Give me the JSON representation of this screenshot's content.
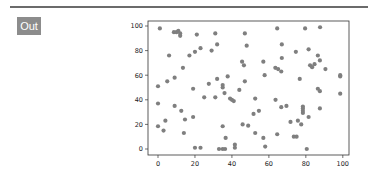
{
  "cell": {
    "prompt_label": "Out"
  },
  "chart_data": {
    "type": "scatter",
    "title": "",
    "xlabel": "",
    "ylabel": "",
    "xlim": [
      -4,
      104
    ],
    "ylim": [
      -5,
      104
    ],
    "grid": false,
    "legend": null,
    "x_ticks": [
      0,
      20,
      40,
      60,
      80,
      100
    ],
    "y_ticks": [
      0,
      20,
      40,
      60,
      80,
      100
    ],
    "marker_color": "#7f7f7f",
    "series": [
      {
        "name": "points",
        "points": [
          [
            1,
            98
          ],
          [
            8.6,
            95
          ],
          [
            10,
            95
          ],
          [
            11,
            96
          ],
          [
            12,
            94
          ],
          [
            12,
            92
          ],
          [
            21,
            93
          ],
          [
            31,
            94
          ],
          [
            6,
            76
          ],
          [
            17,
            76
          ],
          [
            20,
            79
          ],
          [
            23,
            82
          ],
          [
            29,
            80
          ],
          [
            32,
            85
          ],
          [
            13.5,
            66
          ],
          [
            0,
            51
          ],
          [
            5,
            55
          ],
          [
            9,
            58
          ],
          [
            19,
            49
          ],
          [
            27.5,
            53
          ],
          [
            25,
            42
          ],
          [
            31,
            42
          ],
          [
            0,
            37
          ],
          [
            9,
            35
          ],
          [
            12.6,
            31
          ],
          [
            14.6,
            24
          ],
          [
            19,
            26
          ],
          [
            4,
            23
          ],
          [
            0,
            18.5
          ],
          [
            3,
            15
          ],
          [
            14,
            13
          ],
          [
            20,
            1
          ],
          [
            23,
            1
          ],
          [
            47,
            94
          ],
          [
            48,
            84
          ],
          [
            64.5,
            98
          ],
          [
            67,
            85
          ],
          [
            67,
            74
          ],
          [
            45.5,
            71
          ],
          [
            46.5,
            68
          ],
          [
            57,
            71
          ],
          [
            63.5,
            66
          ],
          [
            65,
            65
          ],
          [
            66.7,
            63
          ],
          [
            57.7,
            60
          ],
          [
            32,
            57
          ],
          [
            37.7,
            59
          ],
          [
            47,
            55
          ],
          [
            35,
            52
          ],
          [
            35,
            50
          ],
          [
            44,
            48
          ],
          [
            36,
            45.5
          ],
          [
            39,
            41
          ],
          [
            40,
            40
          ],
          [
            41,
            39
          ],
          [
            52.6,
            41
          ],
          [
            63.6,
            40
          ],
          [
            66.7,
            34
          ],
          [
            54.6,
            31
          ],
          [
            51.7,
            28.5
          ],
          [
            35,
            18.5
          ],
          [
            45.8,
            20
          ],
          [
            48.8,
            19
          ],
          [
            52.6,
            13
          ],
          [
            57,
            9
          ],
          [
            64.5,
            12
          ],
          [
            36.6,
            9
          ],
          [
            41.6,
            3.5
          ],
          [
            41.6,
            1
          ],
          [
            33,
            0
          ],
          [
            35,
            0
          ],
          [
            36.3,
            0
          ],
          [
            58,
            2
          ],
          [
            79.6,
            98
          ],
          [
            87.7,
            99
          ],
          [
            74.6,
            79
          ],
          [
            81.5,
            81
          ],
          [
            86.5,
            76
          ],
          [
            87.6,
            72
          ],
          [
            84.7,
            69
          ],
          [
            82.3,
            68
          ],
          [
            83.4,
            66.5
          ],
          [
            90.6,
            65
          ],
          [
            98.6,
            60
          ],
          [
            98.6,
            59
          ],
          [
            76.7,
            57
          ],
          [
            86.5,
            49
          ],
          [
            87.6,
            47
          ],
          [
            98.6,
            45
          ],
          [
            69.5,
            35
          ],
          [
            78.4,
            34.5
          ],
          [
            78.4,
            33
          ],
          [
            78.4,
            31
          ],
          [
            78.4,
            29.3
          ],
          [
            87.6,
            33
          ],
          [
            81.5,
            26
          ],
          [
            71.7,
            22
          ],
          [
            75.7,
            23
          ],
          [
            77.5,
            20
          ],
          [
            73.5,
            10
          ],
          [
            75,
            10
          ],
          [
            80.5,
            0
          ]
        ]
      }
    ]
  }
}
